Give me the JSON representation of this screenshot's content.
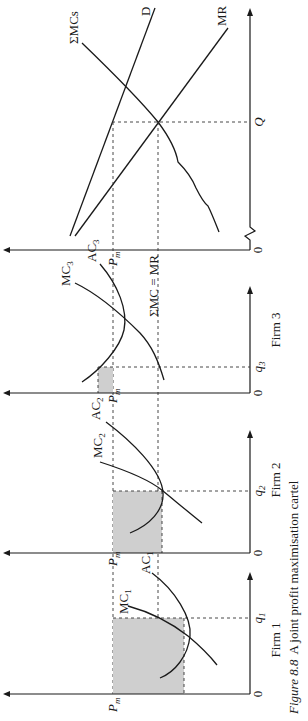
{
  "figure": {
    "caption_prefix": "Figure 8.8",
    "caption_text": "A joint profit maximisation cartel",
    "orientation": "rotated 90° counter-clockwise (text reads bottom-to-top)"
  },
  "panels": {
    "firm1": {
      "title": "Firm 1",
      "origin": "0",
      "quantity_label": "q",
      "quantity_sub": "1",
      "price_label": "P",
      "price_sub": "m",
      "mc_label": "MC",
      "mc_sub": "1",
      "ac_label": "AC",
      "ac_sub": "1",
      "profit_area": "shaded (profit)"
    },
    "firm2": {
      "title": "Firm 2",
      "origin": "0",
      "quantity_label": "q",
      "quantity_sub": "2",
      "price_label": "P",
      "price_sub": "m",
      "mc_label": "MC",
      "mc_sub": "2",
      "ac_label": "AC",
      "ac_sub": "2",
      "profit_area": "shaded (profit)"
    },
    "firm3": {
      "title": "Firm 3",
      "origin": "0",
      "quantity_label": "q",
      "quantity_sub": "3",
      "price_label": "P",
      "price_sub": "m",
      "mc_label": "MC",
      "mc_sub": "3",
      "ac_label": "AC",
      "ac_sub": "3",
      "profit_area": "shaded (small)"
    },
    "market": {
      "origin": "0",
      "quantity_label": "Q",
      "demand_label": "D",
      "mr_label": "MR",
      "sum_mc_label": "ΣMCs",
      "equilibrium_label": "ΣMC = MR"
    }
  },
  "colors": {
    "line": "#1a1a1a",
    "shade": "#cfcfcf",
    "background": "#ffffff"
  }
}
